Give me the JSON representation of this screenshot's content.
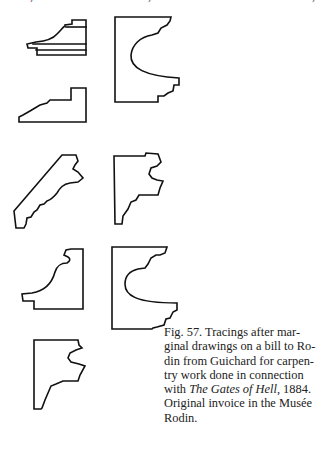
{
  "figure": {
    "number_label": "Fig. 57.",
    "caption_lines": [
      "Fig. 57. Tracings after mar-",
      "ginal drawings on a bill to Ro-",
      "din from Guichard for carpen-",
      "try work done in connection",
      "with ",
      "The Gates of Hell",
      ", 1884.",
      "Original invoice in the Musée",
      "Rodin."
    ],
    "italic_title": "The Gates of Hell",
    "drawing_count": 8,
    "drawings": [
      {
        "id": "molding-1",
        "description": "stepped cornice profile with layered base"
      },
      {
        "id": "molding-2",
        "description": "large frame profile with concave cove"
      },
      {
        "id": "molding-3",
        "description": "stepped ogee base profile"
      },
      {
        "id": "molding-4",
        "description": "diagonal crown molding profile"
      },
      {
        "id": "molding-5",
        "description": "narrow bracket profile with scotia"
      },
      {
        "id": "molding-6",
        "description": "cove and fillet profile"
      },
      {
        "id": "molding-7",
        "description": "large frame profile with deep cove"
      },
      {
        "id": "molding-8",
        "description": "narrow bracket profile (repeat)"
      }
    ]
  }
}
